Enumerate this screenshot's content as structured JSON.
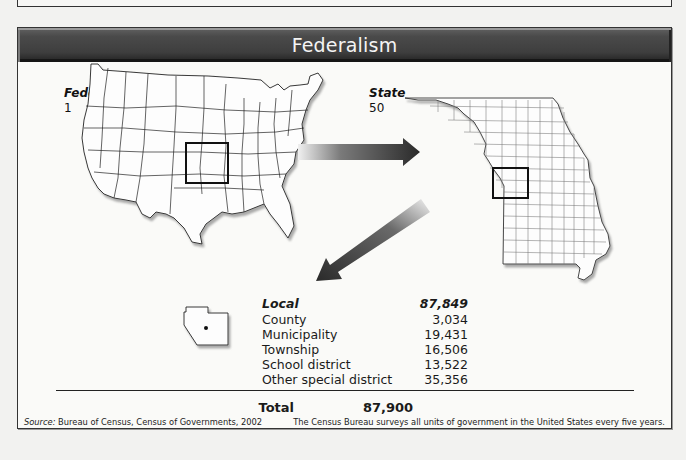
{
  "title": "Federalism",
  "federal": {
    "label": "Federal",
    "count": "1"
  },
  "state": {
    "label": "State",
    "count": "50"
  },
  "local": {
    "label": "Local",
    "count": "87,849",
    "rows": [
      {
        "label": "County",
        "value": "3,034"
      },
      {
        "label": "Municipality",
        "value": "19,431"
      },
      {
        "label": "Township",
        "value": "16,506"
      },
      {
        "label": "School district",
        "value": "13,522"
      },
      {
        "label": "Other special district",
        "value": "35,356"
      }
    ]
  },
  "total": {
    "label": "Total",
    "value": "87,900"
  },
  "footer": {
    "source_prefix": "Source:",
    "source_text": " Bureau of Census, Census of Governments, 2002",
    "note": "The Census Bureau surveys all units of government in the United States every five years."
  },
  "icons": {
    "us_map": "us-map-icon",
    "missouri_map": "missouri-map-icon",
    "county_shape": "county-shape-icon",
    "arrow_right": "arrow-right-icon",
    "arrow_down_left": "arrow-down-left-icon"
  },
  "colors": {
    "header_bg": "#3e3e3e",
    "header_text": "#f4f4f4",
    "border": "#333333",
    "arrow_dark": "#2a2a2a",
    "background": "#fafaf8"
  }
}
